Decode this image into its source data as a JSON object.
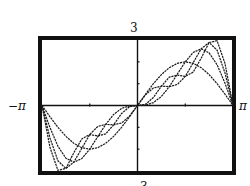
{
  "chart_data": {
    "type": "line",
    "title": "",
    "xlabel": "",
    "ylabel": "",
    "xlim_labels": {
      "min": "−π",
      "max": "π"
    },
    "ylim_labels": {
      "max": "3",
      "min": "−3"
    },
    "xlim": [
      -3.14159,
      3.14159
    ],
    "ylim": [
      -3,
      3
    ],
    "grid": false,
    "legend": null,
    "x_ticks": [
      -1.5708,
      1.5708
    ],
    "y_ticks": [
      -2,
      -1,
      1,
      2
    ],
    "x": [
      0,
      0.2618,
      0.5236,
      0.7854,
      1.0472,
      1.309,
      1.5708,
      1.8326,
      2.0944,
      2.3562,
      2.618,
      2.8798,
      3.14159
    ],
    "series": [
      {
        "name": "S1",
        "values": [
          0,
          0.518,
          1.0,
          1.414,
          1.732,
          1.932,
          2.0,
          1.932,
          1.732,
          1.414,
          1.0,
          0.518,
          0
        ]
      },
      {
        "name": "S2",
        "values": [
          0,
          0.018,
          0.134,
          0.414,
          0.866,
          1.432,
          2.0,
          2.432,
          2.598,
          2.414,
          1.866,
          1.018,
          0
        ]
      },
      {
        "name": "S3",
        "values": [
          0,
          0.489,
          0.801,
          0.886,
          0.866,
          0.961,
          1.333,
          1.961,
          2.598,
          2.886,
          2.533,
          1.489,
          0
        ]
      },
      {
        "name": "S4",
        "values": [
          0,
          0.056,
          0.368,
          0.886,
          1.299,
          1.394,
          1.333,
          1.528,
          2.165,
          2.886,
          2.966,
          1.922,
          0
        ]
      }
    ],
    "symmetry": "odd"
  },
  "colors": {
    "frame": "#111111",
    "curve": "#1a1a1a",
    "background": "#ffffff"
  }
}
